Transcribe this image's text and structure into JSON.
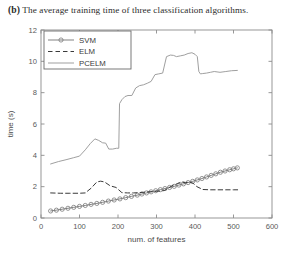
{
  "caption": {
    "label": "(b)",
    "text": "The average training time of three classification algorithms."
  },
  "chart_data": {
    "type": "line",
    "title": "",
    "xlabel": "num. of features",
    "ylabel": "time (s)",
    "xlim": [
      0,
      600
    ],
    "ylim": [
      0,
      12
    ],
    "xticks": [
      0,
      100,
      200,
      300,
      400,
      500,
      600
    ],
    "yticks": [
      0,
      2,
      4,
      6,
      8,
      10,
      12
    ],
    "grid": false,
    "legend_position": "top-left",
    "legend_entries": [
      "SVM",
      "ELM",
      "PCELM"
    ],
    "series": [
      {
        "name": "SVM",
        "style": "solid-with-circle-markers",
        "color": "#7a7a7a",
        "marker": "circle",
        "x": [
          25,
          40,
          55,
          70,
          85,
          100,
          115,
          130,
          145,
          160,
          175,
          190,
          205,
          220,
          235,
          250,
          262,
          274,
          286,
          298,
          310,
          322,
          334,
          346,
          358,
          370,
          382,
          394,
          406,
          418,
          430,
          442,
          454,
          466,
          478,
          490,
          500,
          510
        ],
        "y": [
          0.45,
          0.5,
          0.56,
          0.62,
          0.68,
          0.74,
          0.8,
          0.87,
          0.93,
          1.0,
          1.08,
          1.15,
          1.22,
          1.3,
          1.38,
          1.46,
          1.53,
          1.6,
          1.67,
          1.74,
          1.81,
          1.88,
          1.95,
          2.02,
          2.1,
          2.18,
          2.26,
          2.34,
          2.43,
          2.52,
          2.62,
          2.72,
          2.82,
          2.92,
          3.0,
          3.08,
          3.14,
          3.2
        ]
      },
      {
        "name": "ELM",
        "style": "dashed",
        "color": "#3a3a3a",
        "marker": "none",
        "x": [
          25,
          50,
          75,
          100,
          115,
          130,
          145,
          155,
          165,
          180,
          195,
          210,
          225,
          240,
          255,
          270,
          285,
          300,
          320,
          340,
          355,
          365,
          375,
          385,
          395,
          405,
          420,
          440,
          460,
          480,
          500,
          515
        ],
        "y": [
          1.6,
          1.58,
          1.58,
          1.58,
          1.6,
          1.9,
          2.3,
          2.35,
          2.3,
          2.05,
          1.95,
          1.62,
          1.6,
          1.6,
          1.62,
          1.65,
          1.68,
          1.7,
          1.75,
          2.05,
          2.2,
          2.3,
          2.25,
          2.3,
          2.22,
          2.0,
          1.82,
          1.8,
          1.8,
          1.8,
          1.8,
          1.8
        ]
      },
      {
        "name": "PCELM",
        "style": "solid",
        "color": "#9a9a9a",
        "marker": "none",
        "x": [
          25,
          45,
          65,
          85,
          100,
          115,
          128,
          140,
          150,
          160,
          168,
          176,
          186,
          196,
          202,
          204,
          210,
          218,
          226,
          236,
          246,
          256,
          266,
          276,
          286,
          296,
          306,
          316,
          326,
          336,
          344,
          352,
          362,
          372,
          382,
          392,
          400,
          406,
          410,
          414,
          420,
          430,
          440,
          450,
          465,
          480,
          495,
          510
        ],
        "y": [
          3.45,
          3.6,
          3.72,
          3.85,
          3.95,
          4.35,
          4.75,
          5.05,
          4.95,
          4.8,
          4.78,
          4.4,
          4.4,
          4.45,
          4.45,
          7.3,
          7.55,
          7.75,
          7.82,
          7.82,
          8.3,
          8.45,
          8.5,
          8.6,
          8.72,
          9.15,
          9.2,
          9.25,
          10.3,
          10.4,
          10.38,
          10.3,
          10.35,
          10.4,
          10.5,
          10.55,
          10.45,
          10.3,
          9.35,
          9.2,
          9.22,
          9.25,
          9.3,
          9.35,
          9.3,
          9.35,
          9.4,
          9.42
        ]
      }
    ]
  }
}
